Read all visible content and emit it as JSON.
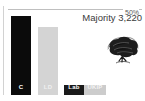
{
  "chart_data": {
    "type": "bar",
    "title": "",
    "subtitle": "",
    "xlabel": "",
    "ylabel": "",
    "categories": [
      "C",
      "LD",
      "Lab",
      "UKIP"
    ],
    "series": [
      {
        "name": "Vote share",
        "values": [
          48,
          41,
          5,
          4
        ]
      }
    ],
    "ylim": [
      0,
      52
    ],
    "grid": true,
    "gridlines": [
      {
        "value": 50,
        "label": "50%"
      }
    ],
    "legend": "none",
    "annotations": [
      {
        "text": "Majority 3,220",
        "position": "top-right"
      }
    ],
    "bar_colors": [
      "#0b0b0b",
      "#d4d4d4",
      "#1a1a1a",
      "#cccccc"
    ],
    "bar_label_colors": [
      "#ffffff",
      "#f0f0f0",
      "#ffffff",
      "#f4f4f4"
    ]
  },
  "axis": {
    "gridline_label": "50%"
  },
  "annotation": {
    "majority": "Majority 3,220"
  },
  "bars": [
    {
      "id": "c",
      "label": "C"
    },
    {
      "id": "ld",
      "label": "LD"
    },
    {
      "id": "lab",
      "label": "Lab"
    },
    {
      "id": "ukip",
      "label": "UKIP"
    }
  ],
  "logo": {
    "name": "oak-tree-logo",
    "alt": "Conservative Party oak tree emblem"
  },
  "colors": {
    "gridline": "#bfbfbf",
    "axis": "#d2d2d2",
    "text": "#3b3b3b",
    "tick_text": "#5a5a5a",
    "background": "#ffffff"
  }
}
